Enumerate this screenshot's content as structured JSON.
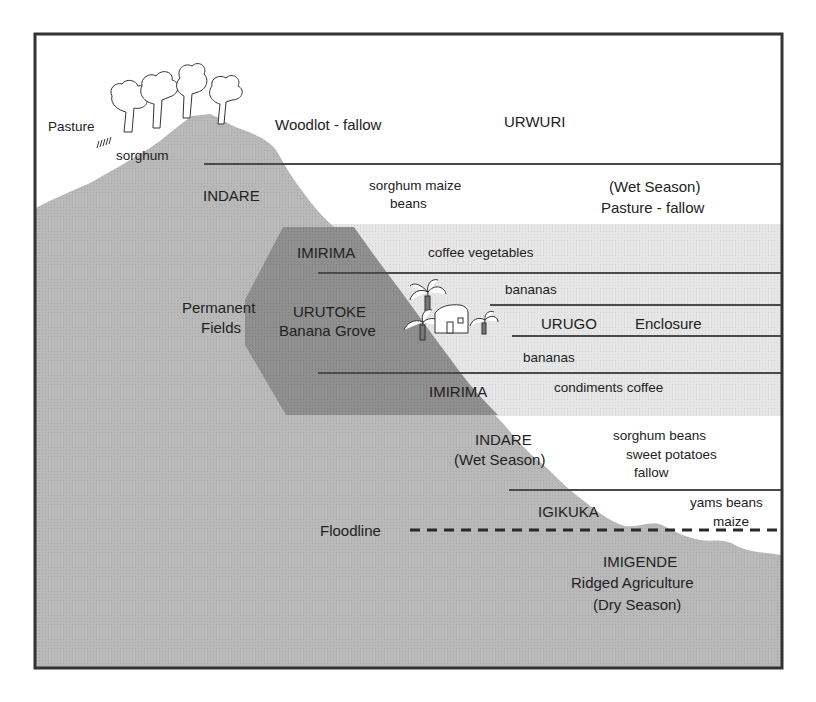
{
  "diagram": {
    "title_zone_top": "URWURI",
    "colors": {
      "hill": "#b8b8b8",
      "hill_dark": "#8e8e8e",
      "band_light": "#e4e4e4",
      "line": "#4a4a4a",
      "frame": "#333333",
      "text": "#222222"
    },
    "labels": {
      "pasture": "Pasture",
      "sorghum_top": "sorghum",
      "woodlot": "Woodlot - fallow",
      "urwuri": "URWURI",
      "indare_top": "INDARE",
      "sorghum_maize": "sorghum  maize",
      "beans_top": "beans",
      "wet_season_top": "(Wet Season)",
      "pasture_fallow": "Pasture - fallow",
      "imirima_top": "IMIRIMA",
      "coffee_vegetables": "coffee  vegetables",
      "permanent": "Permanent",
      "fields": "Fields",
      "urutoke": "URUTOKE",
      "banana_grove": "Banana Grove",
      "bananas_upper": "bananas",
      "urugo": "URUGO",
      "enclosure": "Enclosure",
      "bananas_lower": "bananas",
      "imirima_bottom": "IMIRIMA",
      "condiments_coffee": "condiments  coffee",
      "indare_bottom": "INDARE",
      "wet_season_bottom": "(Wet Season)",
      "sorghum_beans": "sorghum  beans",
      "sweet_potatoes": "sweet potatoes",
      "fallow": "fallow",
      "igikuka": "IGIKUKA",
      "yams_beans": "yams  beans",
      "maize": "maize",
      "floodline": "Floodline",
      "imigende": "IMIGENDE",
      "ridged_agriculture": "Ridged Agriculture",
      "dry_season": "(Dry Season)"
    },
    "icons": [
      "tree-icon",
      "grass-icon",
      "banana-tree-icon",
      "house-icon"
    ]
  }
}
